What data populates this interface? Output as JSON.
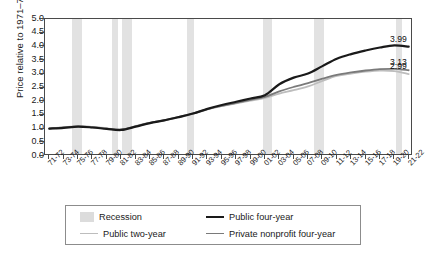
{
  "chart_data": {
    "type": "line",
    "title": "",
    "xlabel": "",
    "ylabel": "Price relative to 1971–72",
    "ylim": [
      0.0,
      5.0
    ],
    "yticks": [
      0.0,
      0.5,
      1.0,
      1.5,
      2.0,
      2.5,
      3.0,
      3.5,
      4.0,
      4.5,
      5.0
    ],
    "ytick_labels": [
      "0.0",
      "0.5",
      "1.0",
      "1.5",
      "2.0",
      "2.5",
      "3.0",
      "3.5",
      "4.0",
      "4.5",
      "5.0"
    ],
    "grid": false,
    "legend_position": "bottom",
    "categories": [
      "71-72",
      "73-74",
      "75-76",
      "77-78",
      "79-80",
      "81-82",
      "83-84",
      "85-86",
      "87-88",
      "89-90",
      "91-92",
      "93-94",
      "95-96",
      "97-98",
      "99-00",
      "01-02",
      "03-04",
      "05-06",
      "07-08",
      "09-10",
      "11-12",
      "13-14",
      "15-16",
      "17-18",
      "19-20",
      "21-22"
    ],
    "series": [
      {
        "name": "Public four-year",
        "color": "#1a1a1a",
        "width": 2.2,
        "end_label": "3.99",
        "values": [
          1.0,
          1.03,
          1.07,
          1.04,
          0.99,
          0.95,
          1.07,
          1.2,
          1.3,
          1.42,
          1.55,
          1.72,
          1.86,
          1.98,
          2.1,
          2.22,
          2.62,
          2.86,
          3.01,
          3.28,
          3.55,
          3.72,
          3.85,
          3.96,
          4.04,
          3.99
        ]
      },
      {
        "name": "Private nonprofit four-year",
        "color": "#7a7a7a",
        "width": 1.8,
        "end_label": "3.13",
        "values": [
          1.0,
          1.04,
          1.08,
          1.05,
          1.0,
          0.96,
          1.08,
          1.21,
          1.31,
          1.43,
          1.56,
          1.71,
          1.83,
          1.94,
          2.05,
          2.16,
          2.36,
          2.52,
          2.66,
          2.82,
          2.96,
          3.05,
          3.12,
          3.17,
          3.18,
          3.13
        ]
      },
      {
        "name": "Public two-year",
        "color": "#bdbdbd",
        "width": 1.8,
        "end_label": "2.99",
        "values": [
          1.0,
          1.05,
          1.09,
          1.06,
          1.01,
          0.97,
          1.09,
          1.22,
          1.3,
          1.41,
          1.54,
          1.7,
          1.82,
          1.92,
          2.02,
          2.12,
          2.28,
          2.4,
          2.54,
          2.74,
          2.92,
          3.01,
          3.08,
          3.12,
          3.1,
          2.99
        ]
      }
    ],
    "recession_bands": [
      {
        "label": "1973-75",
        "start": 1.55,
        "end": 2.25
      },
      {
        "label": "1980",
        "start": 4.35,
        "end": 4.8
      },
      {
        "label": "1981-82",
        "start": 5.05,
        "end": 5.75
      },
      {
        "label": "1990-91",
        "start": 9.55,
        "end": 10.05
      },
      {
        "label": "2001",
        "start": 14.85,
        "end": 15.5
      },
      {
        "label": "2007-09",
        "start": 18.4,
        "end": 19.1
      },
      {
        "label": "2020",
        "start": 24.1,
        "end": 24.55
      }
    ]
  },
  "legend": {
    "items": [
      {
        "label": "Recession",
        "kind": "box",
        "color": "#dcdcdc"
      },
      {
        "label": "Public four-year",
        "kind": "line",
        "color": "#1a1a1a",
        "width": 2.4
      },
      {
        "label": "Public two-year",
        "kind": "line",
        "color": "#bdbdbd",
        "width": 1.8
      },
      {
        "label": "Private nonprofit four-year",
        "kind": "line",
        "color": "#7a7a7a",
        "width": 1.8
      }
    ]
  }
}
